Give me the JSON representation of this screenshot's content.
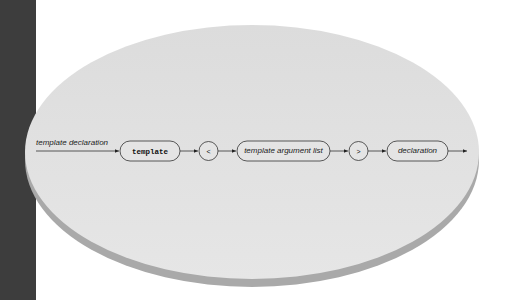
{
  "diagram": {
    "type": "syntax-diagram",
    "rule_name": "template declaration",
    "nodes": [
      {
        "id": "template",
        "label": "template",
        "kind": "terminal-keyword"
      },
      {
        "id": "lt",
        "label": "<",
        "kind": "terminal-symbol"
      },
      {
        "id": "targlist",
        "label": "template argument list",
        "kind": "nonterminal"
      },
      {
        "id": "gt",
        "label": ">",
        "kind": "terminal-symbol"
      },
      {
        "id": "decl",
        "label": "declaration",
        "kind": "nonterminal"
      }
    ],
    "edges": [
      [
        "start",
        "template"
      ],
      [
        "template",
        "lt"
      ],
      [
        "lt",
        "targlist"
      ],
      [
        "targlist",
        "gt"
      ],
      [
        "gt",
        "decl"
      ],
      [
        "decl",
        "end"
      ]
    ],
    "colors": {
      "strip": "#3d3d3d",
      "disc_top": "#e2e2e2",
      "disc_side": "#a8a8a8",
      "line": "#333333"
    }
  }
}
